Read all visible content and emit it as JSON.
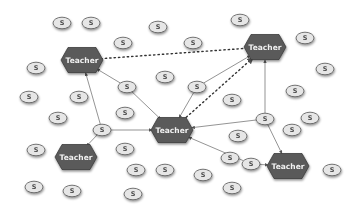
{
  "diagram": {
    "colors": {
      "teacher_fill": "#5a5a5a",
      "teacher_stroke": "#3c3c3c",
      "student_fill": "#e6e6e6",
      "student_stroke": "#555555",
      "edge": "#666666",
      "dotted_edge": "#333333",
      "background": "#ffffff"
    },
    "teacher_label": "Teacher",
    "student_label": "S",
    "teachers": [
      {
        "id": "T1",
        "label": "Teacher",
        "x": 82,
        "y": 60
      },
      {
        "id": "T2",
        "label": "Teacher",
        "x": 265,
        "y": 47
      },
      {
        "id": "T3",
        "label": "Teacher",
        "x": 172,
        "y": 130
      },
      {
        "id": "T4",
        "label": "Teacher",
        "x": 76,
        "y": 157
      },
      {
        "id": "T5",
        "label": "Teacher",
        "x": 288,
        "y": 166
      }
    ],
    "students": [
      {
        "id": "S1",
        "label": "S",
        "x": 62,
        "y": 23
      },
      {
        "id": "S2",
        "label": "S",
        "x": 91,
        "y": 23
      },
      {
        "id": "S3",
        "label": "S",
        "x": 158,
        "y": 27
      },
      {
        "id": "S4",
        "label": "S",
        "x": 240,
        "y": 20
      },
      {
        "id": "S5",
        "label": "S",
        "x": 123,
        "y": 43
      },
      {
        "id": "S6",
        "label": "S",
        "x": 193,
        "y": 43
      },
      {
        "id": "S7",
        "label": "S",
        "x": 305,
        "y": 38
      },
      {
        "id": "S8",
        "label": "S",
        "x": 36,
        "y": 68
      },
      {
        "id": "S9",
        "label": "S",
        "x": 165,
        "y": 77
      },
      {
        "id": "S10",
        "label": "S",
        "x": 325,
        "y": 69
      },
      {
        "id": "S11",
        "label": "S",
        "x": 29,
        "y": 97
      },
      {
        "id": "S12",
        "label": "S",
        "x": 79,
        "y": 97
      },
      {
        "id": "S13",
        "label": "S",
        "x": 127,
        "y": 87
      },
      {
        "id": "S14",
        "label": "S",
        "x": 197,
        "y": 87
      },
      {
        "id": "S15",
        "label": "S",
        "x": 232,
        "y": 100
      },
      {
        "id": "S16",
        "label": "S",
        "x": 295,
        "y": 91
      },
      {
        "id": "S17",
        "label": "S",
        "x": 58,
        "y": 118
      },
      {
        "id": "S18",
        "label": "S",
        "x": 125,
        "y": 113
      },
      {
        "id": "S19",
        "label": "S",
        "x": 102,
        "y": 130
      },
      {
        "id": "S20",
        "label": "S",
        "x": 265,
        "y": 119
      },
      {
        "id": "S21",
        "label": "S",
        "x": 310,
        "y": 118
      },
      {
        "id": "S22",
        "label": "S",
        "x": 292,
        "y": 130
      },
      {
        "id": "S23",
        "label": "S",
        "x": 238,
        "y": 136
      },
      {
        "id": "S24",
        "label": "S",
        "x": 36,
        "y": 150
      },
      {
        "id": "S25",
        "label": "S",
        "x": 125,
        "y": 149
      },
      {
        "id": "S26",
        "label": "S",
        "x": 230,
        "y": 158
      },
      {
        "id": "S27",
        "label": "S",
        "x": 251,
        "y": 164
      },
      {
        "id": "S28",
        "label": "S",
        "x": 136,
        "y": 170
      },
      {
        "id": "S29",
        "label": "S",
        "x": 165,
        "y": 170
      },
      {
        "id": "S30",
        "label": "S",
        "x": 203,
        "y": 175
      },
      {
        "id": "S31",
        "label": "S",
        "x": 332,
        "y": 170
      },
      {
        "id": "S32",
        "label": "S",
        "x": 34,
        "y": 187
      },
      {
        "id": "S33",
        "label": "S",
        "x": 72,
        "y": 191
      },
      {
        "id": "S34",
        "label": "S",
        "x": 133,
        "y": 194
      },
      {
        "id": "S35",
        "label": "S",
        "x": 232,
        "y": 188
      }
    ],
    "edges": [
      {
        "from": "S13",
        "to": "T1",
        "style": "solid",
        "arrow": true
      },
      {
        "from": "S13",
        "to": "T3",
        "style": "solid",
        "arrow": true
      },
      {
        "from": "S19",
        "to": "T1",
        "style": "solid",
        "arrow": true
      },
      {
        "from": "S19",
        "to": "T3",
        "style": "solid",
        "arrow": true
      },
      {
        "from": "S19",
        "to": "T4",
        "style": "solid",
        "arrow": true
      },
      {
        "from": "S14",
        "to": "T2",
        "style": "solid",
        "arrow": true
      },
      {
        "from": "S14",
        "to": "T3",
        "style": "solid",
        "arrow": true
      },
      {
        "from": "S20",
        "to": "T2",
        "style": "solid",
        "arrow": true
      },
      {
        "from": "S20",
        "to": "T3",
        "style": "solid",
        "arrow": true
      },
      {
        "from": "S20",
        "to": "T5",
        "style": "solid",
        "arrow": true
      },
      {
        "from": "S27",
        "to": "T3",
        "style": "solid",
        "arrow": true
      },
      {
        "from": "S27",
        "to": "T5",
        "style": "solid",
        "arrow": true
      },
      {
        "from": "T1",
        "to": "T2",
        "style": "dotted",
        "arrow": false
      },
      {
        "from": "T3",
        "to": "T2",
        "style": "dotted",
        "arrow": true
      }
    ]
  }
}
